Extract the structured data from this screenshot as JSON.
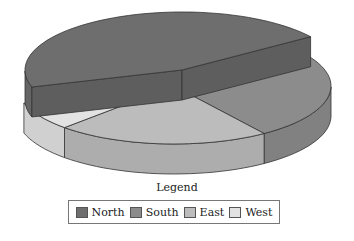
{
  "chart_data": {
    "type": "pie",
    "style": "3d-exploded",
    "title": "",
    "categories": [
      "North",
      "South",
      "East",
      "West"
    ],
    "values": [
      45,
      25,
      22,
      8
    ],
    "unit": "percent (estimated from slice angles)",
    "exploded": [
      "North"
    ],
    "colors": {
      "North": "#6e6e6e",
      "South": "#8c8c8c",
      "East": "#bcbcbc",
      "West": "#e2e2e2"
    },
    "legend": {
      "title": "Legend",
      "position": "bottom",
      "entries": [
        "North",
        "South",
        "East",
        "West"
      ]
    }
  },
  "legend": {
    "title": "Legend",
    "items": [
      {
        "label": "North",
        "color": "#6e6e6e"
      },
      {
        "label": "South",
        "color": "#8c8c8c"
      },
      {
        "label": "East",
        "color": "#bcbcbc"
      },
      {
        "label": "West",
        "color": "#e2e2e2"
      }
    ]
  }
}
